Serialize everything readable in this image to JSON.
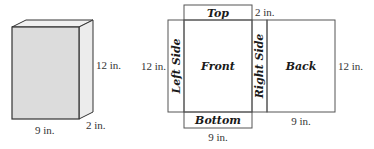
{
  "box": {
    "width_label": "9 in.",
    "depth_label": "2 in.",
    "height_label": "12 in.",
    "colors": {
      "front": "#dcdcdc",
      "side": "#ececec",
      "top": "#f0f0f0",
      "edge": "#333333"
    }
  },
  "net": {
    "faces": {
      "top": "Top",
      "front": "Front",
      "bottom": "Bottom",
      "left_side": "Left Side",
      "right_side": "Right Side",
      "back": "Back"
    },
    "dims": {
      "top_depth": "2 in.",
      "left_height": "12 in.",
      "right_height": "12 in.",
      "bottom_width": "9 in.",
      "back_width": "9 in."
    },
    "colors": {
      "edge": "#555555",
      "fill": "#ffffff"
    }
  }
}
